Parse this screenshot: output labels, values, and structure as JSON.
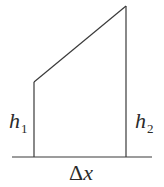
{
  "diagram": {
    "type": "trapezoid-strip",
    "colors": {
      "stroke": "#3a3a3a",
      "text": "#2a2a2a",
      "background": "#ffffff"
    },
    "labels": {
      "left_height": {
        "symbol": "h",
        "subscript": "1"
      },
      "right_height": {
        "symbol": "h",
        "subscript": "2"
      },
      "width": {
        "delta": "Δ",
        "variable": "x"
      }
    }
  }
}
